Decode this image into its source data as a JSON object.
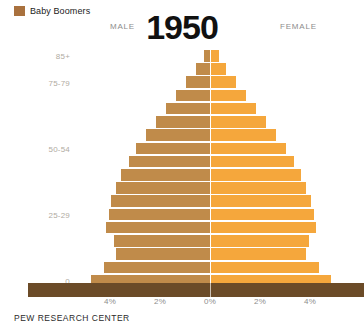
{
  "legend": {
    "label": "Baby Boomers",
    "color": "#A9713E"
  },
  "header": {
    "male": "MALE",
    "female": "FEMALE",
    "year": "1950"
  },
  "footer": {
    "source": "PEW RESEARCH CENTER"
  },
  "colors": {
    "male_bar": "#C08B4A",
    "male_boomer": "#A9713E",
    "female_bar": "#F5A73C",
    "female_boomer": "#F5A73C",
    "baseline": "#6B4B28",
    "axis_label": "#8d8d8d",
    "y_axis_label": "#b0ab9f"
  },
  "chart_data": {
    "type": "bar",
    "subtype": "population-pyramid",
    "title": "1950",
    "xlabel": "",
    "ylabel": "",
    "xlim": [
      -5.2,
      5.2
    ],
    "xticks": [
      -4,
      -2,
      0,
      2,
      4
    ],
    "xtick_labels": [
      "4%",
      "2%",
      "0%",
      "2%",
      "4%"
    ],
    "grid": false,
    "legend_position": "top-left",
    "categories": [
      "85+",
      "80-84",
      "75-79",
      "70-74",
      "65-69",
      "60-64",
      "55-59",
      "50-54",
      "45-49",
      "40-44",
      "35-39",
      "30-34",
      "25-29",
      "20-24",
      "15-19",
      "10-14",
      "5-9",
      "0-4"
    ],
    "ytick_labels": [
      {
        "label": "85+",
        "index": 0
      },
      {
        "label": "75-79",
        "index": 2
      },
      {
        "label": "50-54",
        "index": 7
      },
      {
        "label": "25-29",
        "index": 12
      },
      {
        "label": "0",
        "index": 17
      }
    ],
    "series": [
      {
        "name": "MALE",
        "side": "left",
        "color": "#C08B4A",
        "values": [
          0.25,
          0.55,
          0.95,
          1.35,
          1.75,
          2.15,
          2.55,
          2.95,
          3.25,
          3.55,
          3.75,
          3.95,
          4.05,
          4.15,
          3.85,
          3.75,
          4.25,
          4.75
        ]
      },
      {
        "name": "FEMALE",
        "side": "right",
        "color": "#F5A73C",
        "values": [
          0.3,
          0.6,
          1.0,
          1.4,
          1.8,
          2.2,
          2.6,
          3.0,
          3.3,
          3.6,
          3.8,
          4.0,
          4.1,
          4.2,
          3.9,
          3.8,
          4.3,
          4.8
        ]
      }
    ],
    "boomer_indices": []
  }
}
